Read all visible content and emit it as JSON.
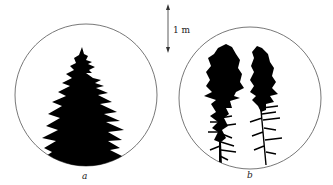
{
  "figure": {
    "scale_bar": {
      "label": "1 m"
    },
    "panels": [
      {
        "id": "a",
        "label": "a",
        "description": "Single conical conifer silhouette with dense branches to the ground"
      },
      {
        "id": "b",
        "label": "b",
        "description": "Two narrow columnar conifer silhouettes with sparse lower branches"
      }
    ],
    "colors": {
      "silhouette": "#000000",
      "outline": "#555555",
      "background": "#ffffff"
    }
  }
}
